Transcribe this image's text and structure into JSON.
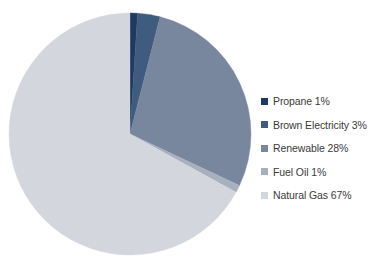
{
  "chart_data": {
    "type": "pie",
    "title": "",
    "subtitle": "",
    "xlabel": "",
    "ylabel": "",
    "legend_position": "right",
    "grid": false,
    "start_angle_clock": "12 o'clock",
    "direction": "clockwise",
    "units": "percent",
    "categories": [
      "Propane",
      "Brown Electricity",
      "Renewable",
      "Fuel Oil",
      "Natural Gas"
    ],
    "values": [
      1,
      3,
      28,
      1,
      67
    ],
    "slices": [
      {
        "label": "Propane",
        "value": 1,
        "value_text": "1%",
        "color": "#1d3a5f",
        "legend_text": "Propane 1%"
      },
      {
        "label": "Brown Electricity",
        "value": 3,
        "value_text": "3%",
        "color": "#3f5b7d",
        "legend_text": "Brown Electricity 3%"
      },
      {
        "label": "Renewable",
        "value": 28,
        "value_text": "28%",
        "color": "#78869e",
        "legend_text": "Renewable 28%"
      },
      {
        "label": "Fuel Oil",
        "value": 1,
        "value_text": "1%",
        "color": "#a8b0bd",
        "legend_text": "Fuel Oil 1%"
      },
      {
        "label": "Natural Gas",
        "value": 67,
        "value_text": "67%",
        "color": "#d3d7dd",
        "legend_text": "Natural Gas 67%"
      }
    ]
  },
  "legend": {
    "items": [
      {
        "label": "Propane 1%",
        "swatch": "#1d3a5f"
      },
      {
        "label": "Brown Electricity 3%",
        "swatch": "#3f5b7d"
      },
      {
        "label": "Renewable 28%",
        "swatch": "#78869e"
      },
      {
        "label": "Fuel Oil 1%",
        "swatch": "#a8b0bd"
      },
      {
        "label": "Natural Gas 67%",
        "swatch": "#d3d7dd"
      }
    ]
  },
  "geometry": {
    "center_x": 130,
    "center_y": 134,
    "radius": 121
  },
  "colors": {
    "background": "#ffffff",
    "text": "#3a3a3a"
  }
}
